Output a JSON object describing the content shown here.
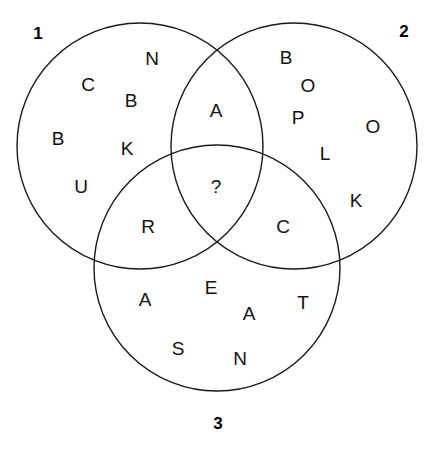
{
  "diagram": {
    "background_color": "#ffffff",
    "stroke_color": "#1a1a1a",
    "text_color": "#111111",
    "width": 437,
    "height": 457,
    "circles": [
      {
        "id": "circle-1",
        "label": "1",
        "cx": 140,
        "cy": 146,
        "r": 123,
        "label_x": 38,
        "label_y": 33
      },
      {
        "id": "circle-2",
        "label": "2",
        "cx": 294,
        "cy": 146,
        "r": 123,
        "label_x": 404,
        "label_y": 31
      },
      {
        "id": "circle-3",
        "label": "3",
        "cx": 217,
        "cy": 268,
        "r": 123,
        "label_x": 218,
        "label_y": 423
      }
    ],
    "regions": [
      {
        "id": "region-1-only",
        "name": "circle-1-exclusive",
        "letters": [
          {
            "char": "N",
            "x": 152,
            "y": 58
          },
          {
            "char": "C",
            "x": 88,
            "y": 84
          },
          {
            "char": "B",
            "x": 131,
            "y": 100
          },
          {
            "char": "B",
            "x": 58,
            "y": 138
          },
          {
            "char": "K",
            "x": 127,
            "y": 148
          },
          {
            "char": "U",
            "x": 81,
            "y": 186
          }
        ]
      },
      {
        "id": "region-2-only",
        "name": "circle-2-exclusive",
        "letters": [
          {
            "char": "B",
            "x": 286,
            "y": 57
          },
          {
            "char": "O",
            "x": 308,
            "y": 85
          },
          {
            "char": "P",
            "x": 298,
            "y": 117
          },
          {
            "char": "O",
            "x": 373,
            "y": 126
          },
          {
            "char": "L",
            "x": 325,
            "y": 153
          },
          {
            "char": "K",
            "x": 356,
            "y": 200
          }
        ]
      },
      {
        "id": "region-3-only",
        "name": "circle-3-exclusive",
        "letters": [
          {
            "char": "A",
            "x": 145,
            "y": 299
          },
          {
            "char": "E",
            "x": 211,
            "y": 287
          },
          {
            "char": "A",
            "x": 249,
            "y": 313
          },
          {
            "char": "T",
            "x": 303,
            "y": 302
          },
          {
            "char": "S",
            "x": 178,
            "y": 348
          },
          {
            "char": "N",
            "x": 240,
            "y": 358
          }
        ]
      },
      {
        "id": "region-1-2",
        "name": "circle-1-and-2-overlap",
        "letters": [
          {
            "char": "A",
            "x": 216,
            "y": 110
          }
        ]
      },
      {
        "id": "region-1-3",
        "name": "circle-1-and-3-overlap",
        "letters": [
          {
            "char": "R",
            "x": 148,
            "y": 226
          }
        ]
      },
      {
        "id": "region-2-3",
        "name": "circle-2-and-3-overlap",
        "letters": [
          {
            "char": "C",
            "x": 283,
            "y": 226
          }
        ]
      },
      {
        "id": "region-center",
        "name": "all-three-overlap",
        "letters": [
          {
            "char": "?",
            "x": 216,
            "y": 186
          }
        ]
      }
    ]
  }
}
